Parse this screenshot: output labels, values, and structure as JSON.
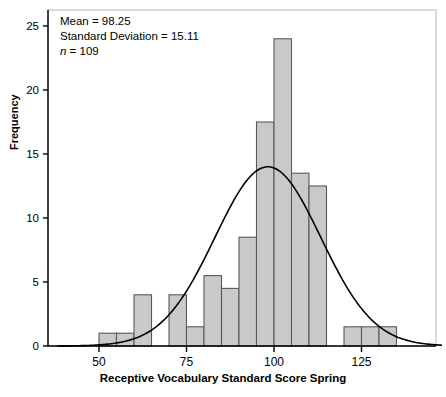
{
  "chart_data": {
    "type": "bar",
    "title": "",
    "subtitle": "",
    "xlabel": "Receptive Vocabulary Standard Score Spring",
    "ylabel": "Frequency",
    "xlim": [
      38,
      148
    ],
    "ylim": [
      0,
      26.5
    ],
    "xticks": [
      50,
      75,
      100,
      125
    ],
    "xtick_labels": [
      "50",
      "75",
      "100",
      "125"
    ],
    "yticks": [
      0,
      5,
      10,
      15,
      20,
      25
    ],
    "ytick_labels": [
      "0",
      "5",
      "10",
      "15",
      "20",
      "25"
    ],
    "grid": false,
    "legend": null,
    "bin_width": 5,
    "bin_edges": [
      50,
      55,
      60,
      65,
      70,
      75,
      80,
      85,
      90,
      95,
      100,
      105,
      110,
      115,
      120,
      125,
      130,
      135
    ],
    "categories": [
      "50-55",
      "55-60",
      "60-65",
      "65-70",
      "70-75",
      "75-80",
      "80-85",
      "85-90",
      "90-95",
      "95-100",
      "100-105",
      "105-110",
      "110-115",
      "115-120",
      "120-125",
      "125-130",
      "130-135"
    ],
    "values": [
      1,
      1,
      4,
      0,
      4,
      1.5,
      5.5,
      4.5,
      8.5,
      17.5,
      24,
      13.5,
      12.5,
      0,
      1.5,
      1.5,
      1.5
    ],
    "bar_fill_color": "#c9c9c9",
    "bar_edge_color": "#595959",
    "curve": {
      "name": "normal-distribution-curve",
      "color": "#000000",
      "mean": 98.25,
      "sd": 15.11,
      "n": 109,
      "peak_value": 14.0
    },
    "annotations": [
      {
        "name": "mean",
        "text": "Mean = 98.25"
      },
      {
        "name": "standard-deviation",
        "text": "Standard Deviation = 15.11"
      },
      {
        "name": "sample-size",
        "text_italic": "n",
        "text": " = 109"
      }
    ]
  },
  "annotation": {
    "mean_line": "Mean = 98.25",
    "sd_line": "Standard Deviation = 15.11",
    "n_symbol": "n",
    "n_value": " = 109"
  },
  "axes": {
    "y_title": "Frequency",
    "x_title": "Receptive Vocabulary Standard Score Spring"
  }
}
